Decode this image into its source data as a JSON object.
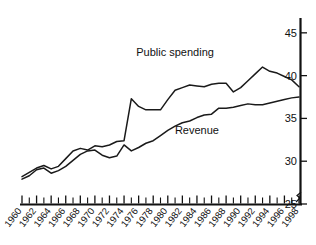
{
  "chart_data": {
    "type": "line",
    "title": "",
    "subtitle": "",
    "xlabel": "",
    "ylabel": "",
    "xlim": [
      1960,
      1998
    ],
    "ylim": [
      25,
      46.5
    ],
    "yticks": [
      25,
      30,
      35,
      40,
      45
    ],
    "ytick_labels": [
      "25",
      "30",
      "35",
      "40",
      "45"
    ],
    "y_axis_position": "right",
    "y_axis_break": true,
    "grid": false,
    "legend_position": "inline-annotations",
    "x": [
      1960,
      1961,
      1962,
      1963,
      1964,
      1965,
      1966,
      1967,
      1968,
      1969,
      1970,
      1971,
      1972,
      1973,
      1974,
      1975,
      1976,
      1977,
      1978,
      1979,
      1980,
      1981,
      1982,
      1983,
      1984,
      1985,
      1986,
      1987,
      1988,
      1989,
      1990,
      1991,
      1992,
      1993,
      1994,
      1995,
      1996,
      1997,
      1998
    ],
    "xtick_labels": [
      "1960",
      "1962",
      "1964",
      "1966",
      "1968",
      "1970",
      "1972",
      "1974",
      "1976",
      "1978",
      "1980",
      "1982",
      "1984",
      "1986",
      "1988",
      "1990",
      "1992",
      "1994",
      "1996",
      "1998"
    ],
    "xtick_label_years": [
      1960,
      1962,
      1964,
      1966,
      1968,
      1970,
      1972,
      1974,
      1976,
      1978,
      1980,
      1982,
      1984,
      1986,
      1988,
      1990,
      1992,
      1994,
      1996,
      1998
    ],
    "series": [
      {
        "name": "Public spending",
        "label": "Public spending",
        "color": "#1a1a1a",
        "values": [
          28.2,
          28.7,
          29.2,
          29.5,
          29.1,
          29.4,
          30.3,
          31.2,
          31.5,
          31.3,
          31.8,
          31.7,
          31.9,
          32.3,
          32.4,
          37.3,
          36.4,
          36.0,
          36.0,
          36.0,
          37.2,
          38.3,
          38.6,
          38.9,
          38.8,
          38.7,
          39.0,
          39.1,
          39.1,
          38.1,
          38.6,
          39.4,
          40.2,
          41.0,
          40.5,
          40.3,
          39.9,
          39.5,
          38.7
        ]
      },
      {
        "name": "Revenue",
        "label": "Revenue",
        "color": "#1a1a1a",
        "values": [
          27.9,
          28.3,
          29.0,
          29.2,
          28.6,
          28.9,
          29.4,
          30.1,
          30.8,
          31.2,
          31.3,
          30.7,
          30.4,
          30.6,
          31.9,
          31.2,
          31.6,
          32.1,
          32.4,
          33.0,
          33.6,
          34.1,
          34.5,
          34.7,
          35.1,
          35.4,
          35.5,
          36.2,
          36.2,
          36.3,
          36.5,
          36.7,
          36.6,
          36.6,
          36.8,
          37.0,
          37.2,
          37.4,
          37.5
        ]
      }
    ],
    "annotations": [
      {
        "text": "Public spending",
        "x": 1981,
        "y": 42.3
      },
      {
        "text": "Revenue",
        "x": 1984,
        "y": 33.2
      }
    ]
  },
  "figure": {
    "background": "#ffffff",
    "axis_color": "#111111",
    "line_color": "#1a1a1a"
  }
}
